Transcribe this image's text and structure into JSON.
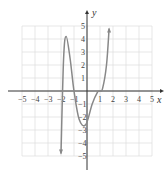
{
  "chart_data": {
    "type": "line",
    "title": "",
    "xlabel": "x",
    "ylabel": "y",
    "xlim": [
      -5,
      5
    ],
    "ylim": [
      -5,
      5
    ],
    "grid": true,
    "x_ticks": [
      "-5",
      "-4",
      "-3",
      "-2",
      "-1",
      "1",
      "2",
      "3",
      "4",
      "5"
    ],
    "y_ticks": [
      "5",
      "4",
      "3",
      "2",
      "1",
      "-1",
      "-2",
      "-3",
      "-4",
      "-5"
    ],
    "series": [
      {
        "name": "f(x)",
        "x": [
          -2.0,
          -1.8,
          -1.6,
          -1.3,
          -1.0,
          -0.6,
          -0.1,
          0.4,
          0.8,
          1.0,
          1.2,
          1.5,
          1.7
        ],
        "y": [
          -4.8,
          2.5,
          4.2,
          2.5,
          0.0,
          -2.2,
          -2.6,
          -1.0,
          -0.1,
          0.0,
          0.2,
          2.0,
          4.8
        ],
        "arrows": [
          "down-start",
          "up-end"
        ]
      }
    ],
    "color": "#888888"
  }
}
